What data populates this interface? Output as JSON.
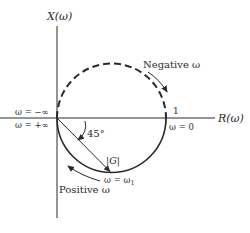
{
  "diagram": {
    "type": "nyquist-plot",
    "axes": {
      "vertical_label": "X(ω)",
      "horizontal_label": "R(ω)"
    },
    "labels": {
      "omega_neg_inf": "ω = −∞",
      "omega_pos_inf": "ω = +∞",
      "angle": "45°",
      "magnitude": "|G|",
      "omega_one": "ω = ω",
      "omega_one_sub": "1",
      "omega_zero": "ω = 0",
      "unit_tick": "1",
      "negative_omega": "Negative ω",
      "positive_omega": "Positive ω"
    },
    "curves": {
      "upper_semicircle": "dashed (negative frequencies)",
      "lower_semicircle": "solid (positive frequencies)"
    },
    "colors": {
      "ink": "#2a2a2a",
      "background": "#ffffff"
    }
  }
}
